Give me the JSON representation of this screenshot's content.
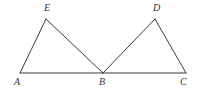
{
  "figure": {
    "kind": "geometry-diagram",
    "background_color": "#ffffff",
    "stroke_color": "#3a3a3a",
    "label_color": "#333333",
    "stroke_width": 1,
    "width": 199,
    "height": 92
  },
  "points": {
    "A": {
      "label": "A",
      "x": 20,
      "y": 73,
      "label_x": 14,
      "label_y": 77
    },
    "B": {
      "label": "B",
      "x": 103,
      "y": 73,
      "label_x": 99,
      "label_y": 77
    },
    "C": {
      "label": "C",
      "x": 186,
      "y": 73,
      "label_x": 180,
      "label_y": 77
    },
    "D": {
      "label": "D",
      "x": 155,
      "y": 19,
      "label_x": 153,
      "label_y": 3
    },
    "E": {
      "label": "E",
      "x": 46,
      "y": 19,
      "label_x": 44,
      "label_y": 3
    }
  },
  "segments": [
    {
      "name": "AC",
      "from": "A",
      "to": "C"
    },
    {
      "name": "AE",
      "from": "A",
      "to": "E"
    },
    {
      "name": "EB",
      "from": "E",
      "to": "B"
    },
    {
      "name": "BD",
      "from": "B",
      "to": "D"
    },
    {
      "name": "DC",
      "from": "D",
      "to": "C"
    }
  ],
  "labels": {
    "A": "A",
    "B": "B",
    "C": "C",
    "D": "D",
    "E": "E"
  }
}
